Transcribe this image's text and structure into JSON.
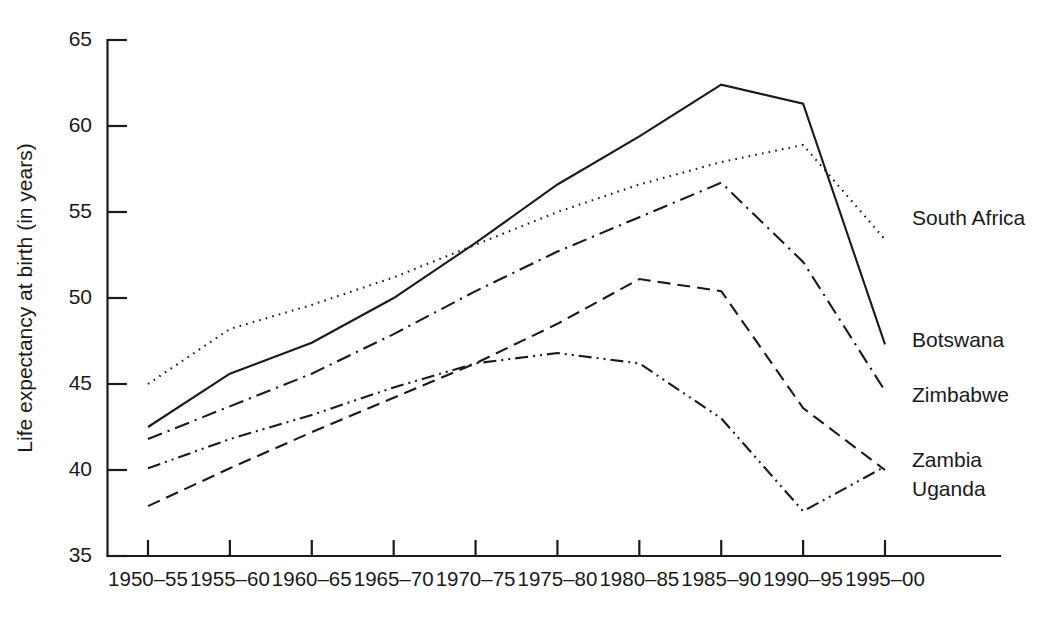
{
  "chart_data": {
    "type": "line",
    "title": "",
    "xlabel": "",
    "ylabel": "Life expectancy at birth (in years)",
    "ylim": [
      35,
      65
    ],
    "yticks": [
      35,
      40,
      45,
      50,
      55,
      60,
      65
    ],
    "ytick_labels": [
      "35",
      "40",
      "45",
      "50",
      "55",
      "60",
      "65"
    ],
    "grid": false,
    "legend_position": "right-inline-labels",
    "categories": [
      "1950–55",
      "1955–60",
      "1960–65",
      "1965–70",
      "1970–75",
      "1975–80",
      "1980–85",
      "1985–90",
      "1990–95",
      "1995–00"
    ],
    "series": [
      {
        "name": "South Africa",
        "style": "dotted",
        "label": "South Africa",
        "values": [
          45.0,
          48.2,
          49.6,
          51.2,
          53.1,
          55.0,
          56.6,
          57.9,
          58.9,
          53.4
        ]
      },
      {
        "name": "Botswana",
        "style": "solid",
        "label": "Botswana",
        "values": [
          42.5,
          45.6,
          47.4,
          50.0,
          53.2,
          56.6,
          59.4,
          62.4,
          61.3,
          47.3
        ]
      },
      {
        "name": "Zimbabwe",
        "style": "dash-dot",
        "label": "Zimbabwe",
        "values": [
          41.8,
          43.7,
          45.6,
          47.9,
          50.4,
          52.7,
          54.7,
          56.7,
          52.1,
          44.6
        ]
      },
      {
        "name": "Zambia",
        "style": "dashed",
        "label": "Zambia",
        "values": [
          37.9,
          40.1,
          42.2,
          44.2,
          46.2,
          48.5,
          51.1,
          50.4,
          43.6,
          40.0
        ]
      },
      {
        "name": "Uganda",
        "style": "dash-dot-dot",
        "label": "Uganda",
        "values": [
          40.1,
          41.8,
          43.2,
          44.8,
          46.2,
          46.8,
          46.2,
          43.0,
          37.6,
          40.2
        ]
      }
    ]
  },
  "axis": {
    "y_title": "Life expectancy at birth (in years)"
  }
}
